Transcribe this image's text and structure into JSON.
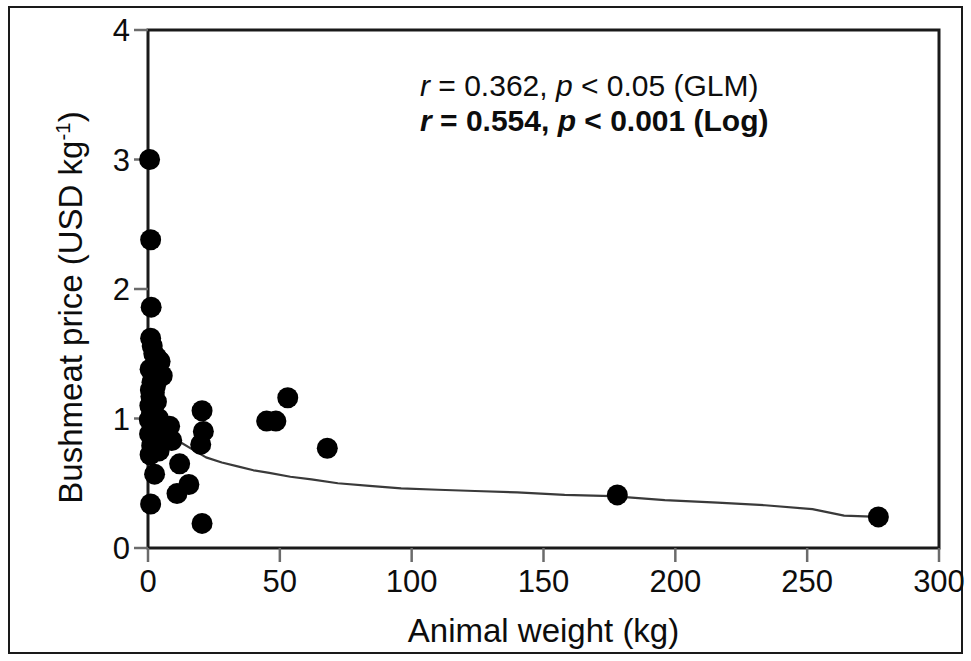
{
  "figure": {
    "background_color": "#ffffff",
    "frame_color": "#1a1a1a",
    "marker_color": "#000000",
    "curve_color": "#3a3a3a"
  },
  "annotations": {
    "glm": {
      "r_symbol": "r",
      "r_text": " = 0.362, ",
      "p_symbol": "p",
      "p_text": " < 0.05  (GLM)",
      "full": "r = 0.362, p < 0.05  (GLM)"
    },
    "log": {
      "r_symbol": "r",
      "r_text": " = 0.554, ",
      "p_symbol": "p",
      "p_text": " < 0.001  (Log)",
      "full": "r = 0.554, p < 0.001  (Log)"
    }
  },
  "axes": {
    "x_title": "Animal weight (kg)",
    "y_title_main": "Bushmeat price (USD kg",
    "y_title_exp": "-1",
    "y_title_close": ")",
    "x_ticks": [
      "0",
      "50",
      "100",
      "150",
      "200",
      "250",
      "300"
    ],
    "y_ticks": [
      "0",
      "1",
      "2",
      "3",
      "4"
    ]
  },
  "chart_data": {
    "type": "scatter",
    "title": "",
    "xlabel": "Animal weight (kg)",
    "ylabel": "Bushmeat price (USD kg-1)",
    "xlim": [
      0,
      300
    ],
    "ylim": [
      0,
      4
    ],
    "xticks": [
      0,
      50,
      100,
      150,
      200,
      250,
      300
    ],
    "yticks": [
      0,
      1,
      2,
      3,
      4
    ],
    "grid": false,
    "legend": null,
    "annotations": [
      "r = 0.362, p < 0.05  (GLM)",
      "r = 0.554, p < 0.001  (Log)"
    ],
    "series": [
      {
        "name": "Bushmeat price observations",
        "type": "scatter",
        "marker": "filled-circle",
        "color": "#000000",
        "points": [
          [
            0.6,
            3.0
          ],
          [
            1.0,
            2.38
          ],
          [
            1.2,
            1.86
          ],
          [
            1.0,
            1.62
          ],
          [
            1.6,
            1.56
          ],
          [
            2.2,
            1.5
          ],
          [
            3.4,
            1.47
          ],
          [
            4.6,
            1.44
          ],
          [
            0.8,
            1.38
          ],
          [
            3.0,
            1.36
          ],
          [
            5.4,
            1.33
          ],
          [
            1.5,
            1.28
          ],
          [
            2.8,
            1.25
          ],
          [
            0.9,
            1.22
          ],
          [
            2.4,
            1.2
          ],
          [
            1.1,
            1.17
          ],
          [
            53.0,
            1.16
          ],
          [
            3.2,
            1.13
          ],
          [
            0.7,
            1.1
          ],
          [
            2.0,
            1.08
          ],
          [
            20.5,
            1.06
          ],
          [
            1.3,
            1.03
          ],
          [
            4.0,
            1.0
          ],
          [
            0.5,
            0.99
          ],
          [
            45.0,
            0.98
          ],
          [
            48.5,
            0.98
          ],
          [
            2.6,
            0.96
          ],
          [
            5.8,
            0.95
          ],
          [
            8.2,
            0.94
          ],
          [
            1.8,
            0.92
          ],
          [
            21.0,
            0.9
          ],
          [
            0.6,
            0.88
          ],
          [
            3.6,
            0.87
          ],
          [
            6.4,
            0.86
          ],
          [
            2.1,
            0.84
          ],
          [
            9.0,
            0.83
          ],
          [
            20.0,
            0.8
          ],
          [
            1.4,
            0.79
          ],
          [
            68.0,
            0.77
          ],
          [
            4.2,
            0.75
          ],
          [
            0.8,
            0.72
          ],
          [
            12.0,
            0.65
          ],
          [
            2.5,
            0.57
          ],
          [
            178.0,
            0.41
          ],
          [
            15.5,
            0.49
          ],
          [
            11.0,
            0.42
          ],
          [
            1.0,
            0.34
          ],
          [
            20.5,
            0.19
          ],
          [
            277.0,
            0.24
          ]
        ]
      },
      {
        "name": "Log fitted curve",
        "type": "line",
        "color": "#3a3a3a",
        "points": [
          [
            0.9,
            1.48
          ],
          [
            2.0,
            1.2
          ],
          [
            3.5,
            1.02
          ],
          [
            5.5,
            0.93
          ],
          [
            8.0,
            0.88
          ],
          [
            12.0,
            0.82
          ],
          [
            17.0,
            0.76
          ],
          [
            22.0,
            0.7
          ],
          [
            28.0,
            0.66
          ],
          [
            34.0,
            0.63
          ],
          [
            40.0,
            0.6
          ],
          [
            46.0,
            0.58
          ],
          [
            54.0,
            0.55
          ],
          [
            62.0,
            0.53
          ],
          [
            72.0,
            0.5
          ],
          [
            84.0,
            0.48
          ],
          [
            96.0,
            0.46
          ],
          [
            110.0,
            0.45
          ],
          [
            124.0,
            0.44
          ],
          [
            140.0,
            0.43
          ],
          [
            158.0,
            0.41
          ],
          [
            176.0,
            0.4
          ],
          [
            196.0,
            0.37
          ],
          [
            216.0,
            0.35
          ],
          [
            234.0,
            0.33
          ],
          [
            252.0,
            0.3
          ],
          [
            264.0,
            0.25
          ],
          [
            277.0,
            0.24
          ]
        ]
      }
    ]
  }
}
